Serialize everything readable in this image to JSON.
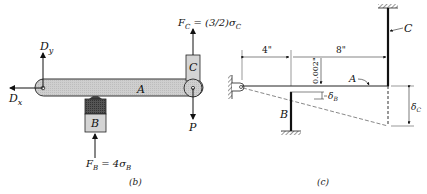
{
  "figure_b": {
    "caption": "(b)",
    "labels": {
      "dy": "Dy",
      "dx": "Dx",
      "a": "A",
      "b": "B",
      "c": "C",
      "p": "P",
      "fc": "F_C = (3/2)σ_C",
      "fb": "F_B = 4σ_B"
    },
    "text": {
      "dy_main": "D",
      "dy_sub": "y",
      "dx_main": "D",
      "dx_sub": "x",
      "fc_main": "F",
      "fc_sub": "C",
      "fc_rhs": " = (3/2)σ",
      "fc_rhs_sub": "C",
      "fb_main": "F",
      "fb_sub": "B",
      "fb_rhs": " = 4σ",
      "fb_rhs_sub": "B"
    }
  },
  "figure_c": {
    "caption": "(c)",
    "dims": {
      "left": "4\"",
      "right": "8\"",
      "gap": "0.002\""
    },
    "labels": {
      "a": "A",
      "b": "B",
      "c": "C",
      "delta_b_main": "δ",
      "delta_b_sub": "B",
      "delta_c_main": "δ",
      "delta_c_sub": "C"
    }
  }
}
